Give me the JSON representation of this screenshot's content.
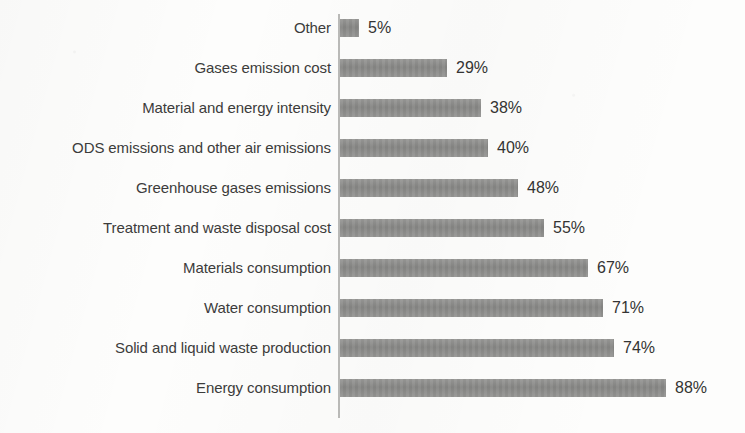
{
  "chart_data": {
    "type": "bar",
    "orientation": "horizontal",
    "title": "",
    "subtitle": "",
    "xlabel": "",
    "ylabel": "",
    "grid": false,
    "legend": null,
    "xlim": [
      0,
      88
    ],
    "value_suffix": "%",
    "categories": [
      "Other",
      "Gases emission cost",
      "Material and energy intensity",
      "ODS emissions and other air emissions",
      "Greenhouse gases emissions",
      "Treatment and waste disposal cost",
      "Materials consumption",
      "Water consumption",
      "Solid and liquid waste production",
      "Energy consumption"
    ],
    "values": [
      5,
      29,
      38,
      40,
      48,
      55,
      67,
      71,
      74,
      88
    ],
    "data_labels": [
      "5%",
      "29%",
      "38%",
      "40%",
      "48%",
      "55%",
      "67%",
      "71%",
      "74%",
      "88%"
    ],
    "colors": {
      "bar": "#8e8e8c",
      "axis": "#b9b9b7",
      "label_text": "#3c3c3b",
      "value_text": "#343433",
      "background": "#fdfdfc"
    }
  }
}
